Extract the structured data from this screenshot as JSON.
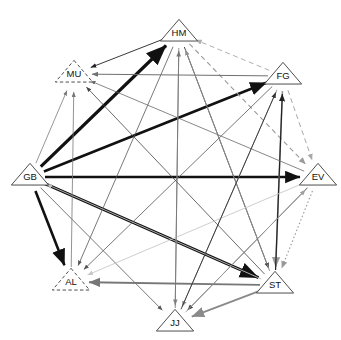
{
  "diagram": {
    "type": "directed-graph",
    "layout": "circular",
    "background": "#ffffff",
    "node_shape": "triangle",
    "nodes": [
      {
        "id": "HM",
        "label": "HM",
        "x": 179,
        "y": 33,
        "border": "solid",
        "size": 19
      },
      {
        "id": "FG",
        "label": "FG",
        "x": 283,
        "y": 76,
        "border": "solid",
        "size": 19
      },
      {
        "id": "EV",
        "label": "EV",
        "x": 318,
        "y": 177,
        "border": "solid",
        "size": 19
      },
      {
        "id": "ST",
        "label": "ST",
        "x": 275,
        "y": 285,
        "border": "solid",
        "size": 19
      },
      {
        "id": "JJ",
        "label": "JJ",
        "x": 175,
        "y": 323,
        "border": "solid",
        "size": 19
      },
      {
        "id": "AL",
        "label": "AL",
        "x": 71,
        "y": 282,
        "border": "dashed",
        "size": 19
      },
      {
        "id": "GB",
        "label": "GB",
        "x": 30,
        "y": 177,
        "border": "solid",
        "size": 19
      },
      {
        "id": "MU",
        "label": "MU",
        "x": 74,
        "y": 74,
        "border": "dashed",
        "size": 19
      }
    ],
    "edges": [
      {
        "from": "GB",
        "to": "HM",
        "color": "#111111",
        "width": 3.2,
        "style": "solid",
        "weight": 3
      },
      {
        "from": "GB",
        "to": "FG",
        "color": "#111111",
        "width": 2.6,
        "style": "solid",
        "weight": 3
      },
      {
        "from": "GB",
        "to": "EV",
        "color": "#111111",
        "width": 2.4,
        "style": "solid",
        "weight": 3
      },
      {
        "from": "GB",
        "to": "AL",
        "color": "#111111",
        "width": 2.6,
        "style": "solid",
        "weight": 3
      },
      {
        "from": "GB",
        "to": "ST",
        "color": "#111111",
        "width": 3.0,
        "style": "solid",
        "weight": 3
      },
      {
        "from": "GB",
        "to": "MU",
        "color": "#7b7b7b",
        "width": 0.8,
        "style": "solid",
        "weight": 1
      },
      {
        "from": "GB",
        "to": "JJ",
        "color": "#555555",
        "width": 0.8,
        "style": "solid",
        "weight": 1
      },
      {
        "from": "HM",
        "to": "MU",
        "color": "#222222",
        "width": 0.9,
        "style": "solid",
        "weight": 1
      },
      {
        "from": "HM",
        "to": "AL",
        "color": "#555555",
        "width": 0.8,
        "style": "solid",
        "weight": 1
      },
      {
        "from": "HM",
        "to": "ST",
        "color": "#333333",
        "width": 0.9,
        "style": "solid",
        "weight": 1
      },
      {
        "from": "HM",
        "to": "EV",
        "color": "#9a9a9a",
        "width": 1.1,
        "style": "dashed",
        "weight": 1
      },
      {
        "from": "HM",
        "to": "JJ",
        "color": "#8a8a8a",
        "width": 0.9,
        "style": "solid",
        "weight": 1
      },
      {
        "from": "FG",
        "to": "MU",
        "color": "#6f6f6f",
        "width": 1.0,
        "style": "solid",
        "weight": 1
      },
      {
        "from": "FG",
        "to": "AL",
        "color": "#555555",
        "width": 0.8,
        "style": "solid",
        "weight": 1
      },
      {
        "from": "FG",
        "to": "ST",
        "color": "#9a9a9a",
        "width": 1.6,
        "style": "solid",
        "weight": 2
      },
      {
        "from": "FG",
        "to": "EV",
        "color": "#a8a8a8",
        "width": 1.0,
        "style": "dashed",
        "weight": 1
      },
      {
        "from": "FG",
        "to": "JJ",
        "color": "#8f8f8f",
        "width": 0.9,
        "style": "solid",
        "weight": 1
      },
      {
        "from": "FG",
        "to": "HM",
        "color": "#b0b0b0",
        "width": 1.0,
        "style": "dashed",
        "weight": 1
      },
      {
        "from": "ST",
        "to": "FG",
        "color": "#222222",
        "width": 1.2,
        "style": "solid",
        "weight": 1
      },
      {
        "from": "ST",
        "to": "AL",
        "color": "#777777",
        "width": 1.8,
        "style": "solid",
        "weight": 2
      },
      {
        "from": "ST",
        "to": "MU",
        "color": "#444444",
        "width": 0.8,
        "style": "solid",
        "weight": 1
      },
      {
        "from": "ST",
        "to": "HM",
        "color": "#8f8f8f",
        "width": 0.9,
        "style": "solid",
        "weight": 1
      },
      {
        "from": "ST",
        "to": "JJ",
        "color": "#8a8a8a",
        "width": 2.0,
        "style": "solid",
        "weight": 2
      },
      {
        "from": "ST",
        "to": "GB",
        "color": "#c0c0c0",
        "width": 0.9,
        "style": "solid",
        "weight": 1
      },
      {
        "from": "EV",
        "to": "ST",
        "color": "#9a9a9a",
        "width": 1.2,
        "style": "dotted",
        "weight": 1
      },
      {
        "from": "EV",
        "to": "JJ",
        "color": "#444444",
        "width": 0.9,
        "style": "solid",
        "weight": 1
      },
      {
        "from": "EV",
        "to": "AL",
        "color": "#c8c8c8",
        "width": 0.9,
        "style": "solid",
        "weight": 1
      },
      {
        "from": "EV",
        "to": "MU",
        "color": "#6a6a6a",
        "width": 0.8,
        "style": "solid",
        "weight": 1
      },
      {
        "from": "JJ",
        "to": "HM",
        "color": "#777777",
        "width": 0.9,
        "style": "solid",
        "weight": 1
      },
      {
        "from": "JJ",
        "to": "FG",
        "color": "#333333",
        "width": 0.9,
        "style": "solid",
        "weight": 1
      },
      {
        "from": "JJ",
        "to": "EV",
        "color": "#9f9f9f",
        "width": 0.9,
        "style": "solid",
        "weight": 1
      },
      {
        "from": "AL",
        "to": "MU",
        "color": "#777777",
        "width": 0.8,
        "style": "solid",
        "weight": 1
      }
    ]
  }
}
